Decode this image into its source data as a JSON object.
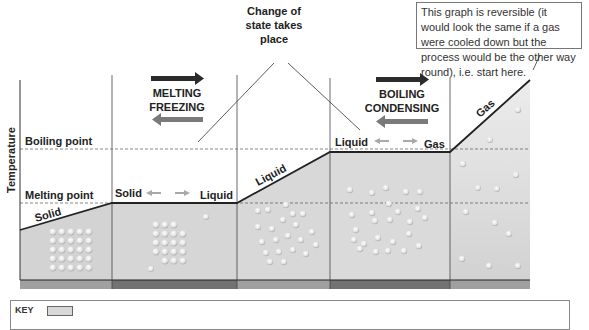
{
  "diagram": {
    "axis": {
      "y_label": "Temperature"
    },
    "levels": {
      "boiling_point": "Boiling point",
      "melting_point": "Melting point"
    },
    "segments": [
      {
        "label": "Solid",
        "type": "heating"
      },
      {
        "label_left": "Solid",
        "label_right": "Liquid",
        "type": "change-of-state"
      },
      {
        "label": "Liquid",
        "type": "heating"
      },
      {
        "label_left": "Liquid",
        "label_right": "Gas",
        "type": "change-of-state"
      },
      {
        "label": "Gas",
        "type": "heating"
      }
    ],
    "process_labels": {
      "melting": "MELTING",
      "freezing": "FREEZING",
      "boiling": "BOILING",
      "condensing": "CONDENSING"
    },
    "callouts": {
      "change_of_state": [
        "Change of",
        "state takes",
        "place"
      ],
      "reversible_note": "This graph is reversible (it would look the same if a gas were cooled down but the process would be the other way round), i.e. start here."
    },
    "key": {
      "label": "KEY"
    },
    "colors": {
      "shade": "#d4d4d4",
      "shade_light": "#e6e6e6",
      "strip_light": "#9a9a9a",
      "strip_dark": "#6e6e6e",
      "arrow_dark": "#2b2b2b",
      "arrow_grey": "#7a7a7a",
      "arrow_light": "#a8a8a8"
    }
  }
}
